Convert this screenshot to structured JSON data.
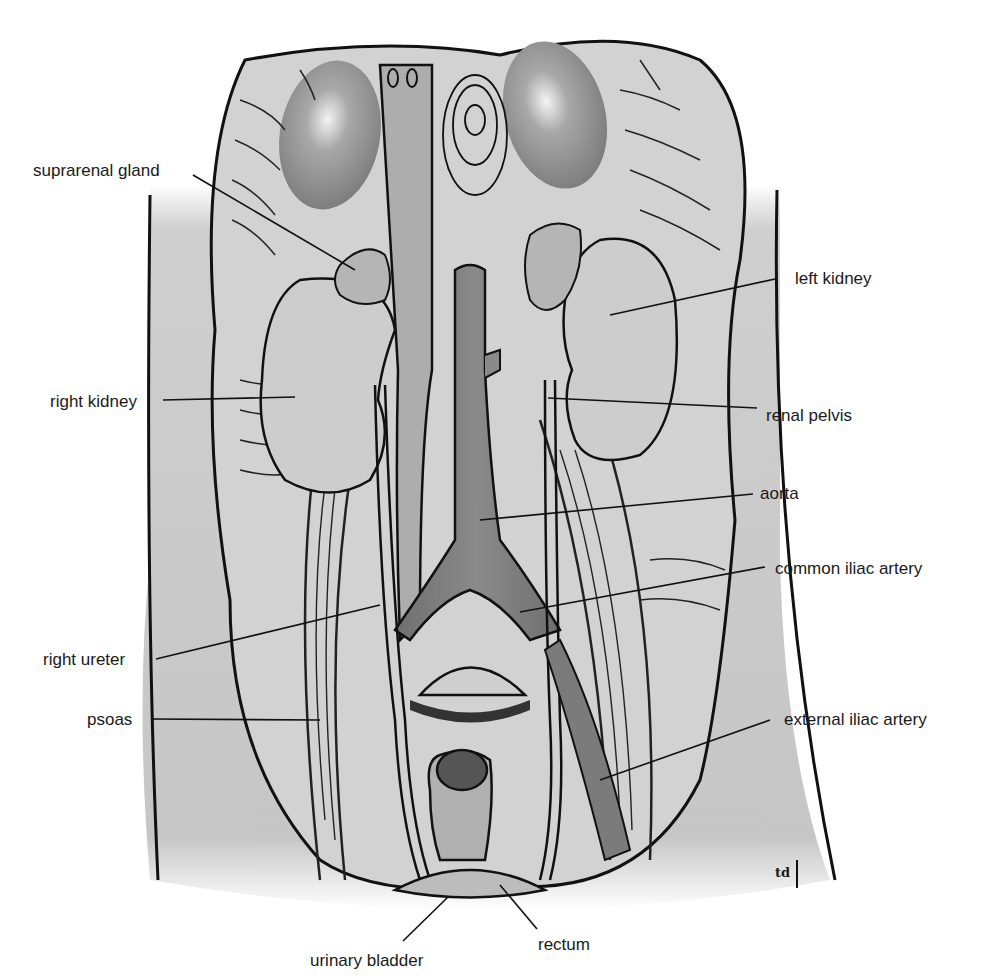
{
  "diagram": {
    "colors": {
      "background": "#ffffff",
      "body_wall": "#c4c4c4",
      "muscle_fill": "#cfcfcf",
      "kidney_fill": "#cdcdcd",
      "vessel_dark": "#7a7a7a",
      "vessel_light": "#b3b3b3",
      "outline": "#111111",
      "label_text": "#1a1a1a"
    },
    "labels": [
      {
        "id": "suprarenal-gland",
        "text": "suprarenal gland"
      },
      {
        "id": "left-kidney",
        "text": "left kidney"
      },
      {
        "id": "right-kidney",
        "text": "right kidney"
      },
      {
        "id": "renal-pelvis",
        "text": "renal pelvis"
      },
      {
        "id": "aorta",
        "text": "aorta"
      },
      {
        "id": "common-iliac-artery",
        "text": "common iliac artery"
      },
      {
        "id": "right-ureter",
        "text": "right ureter"
      },
      {
        "id": "psoas",
        "text": "psoas"
      },
      {
        "id": "external-iliac-artery",
        "text": "external iliac artery"
      },
      {
        "id": "urinary-bladder",
        "text": "urinary bladder"
      },
      {
        "id": "rectum",
        "text": "rectum"
      }
    ],
    "signature": "td"
  }
}
